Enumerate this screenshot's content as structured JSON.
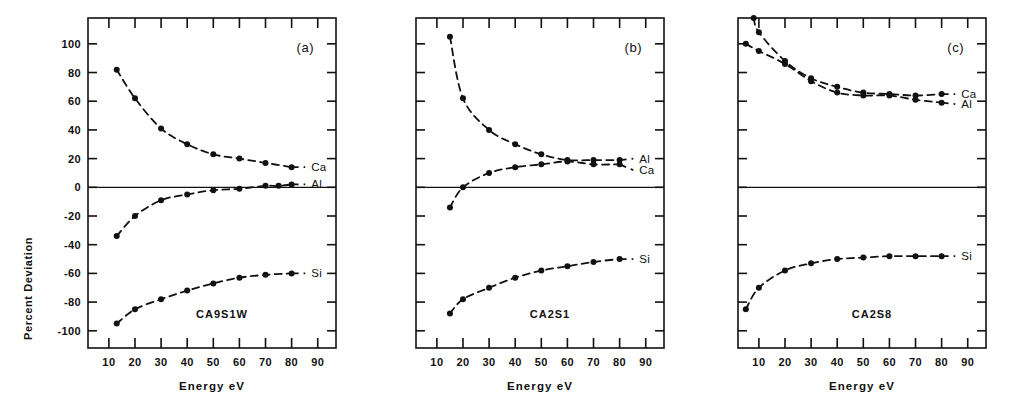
{
  "figure": {
    "background": "#ffffff",
    "ink_color": "#111111",
    "ylabel": "Percent Deviation",
    "xlabel": "Energy eV",
    "y_ticks": [
      100,
      80,
      60,
      40,
      20,
      0,
      -20,
      -40,
      -60,
      -80,
      -100
    ],
    "y_tick_labels": [
      "100",
      "80",
      "60",
      "40",
      "20",
      "0",
      "-20",
      "-40",
      "-60",
      "-80",
      "-100"
    ],
    "x_ticks": [
      10,
      20,
      30,
      40,
      50,
      60,
      70,
      80,
      90
    ],
    "x_tick_labels": [
      "10",
      "20",
      "30",
      "40",
      "50",
      "60",
      "70",
      "80",
      "90"
    ],
    "ylim": [
      -112,
      118
    ],
    "xlim": [
      2,
      97
    ]
  },
  "chart_data": [
    {
      "type": "line",
      "panel_id": "(a)",
      "sample": "CA9S1W",
      "title": "",
      "xlabel": "Energy eV",
      "ylabel": "Percent Deviation",
      "xlim": [
        2,
        97
      ],
      "ylim": [
        -112,
        118
      ],
      "grid": false,
      "legend_position": "right-inline",
      "series": [
        {
          "name": "Ca",
          "label": "Ca",
          "label_x": 86,
          "label_y": 14,
          "x": [
            13,
            20,
            30,
            40,
            50,
            60,
            70,
            80
          ],
          "y": [
            82,
            62,
            41,
            30,
            23,
            20,
            17,
            14
          ]
        },
        {
          "name": "Al",
          "label": "Al",
          "label_x": 86,
          "label_y": 2,
          "x": [
            13,
            20,
            30,
            40,
            50,
            60,
            70,
            75,
            80
          ],
          "y": [
            -34,
            -20,
            -9,
            -5,
            -2,
            -1,
            1,
            1,
            2
          ]
        },
        {
          "name": "Si",
          "label": "Si",
          "label_x": 86,
          "label_y": -60,
          "x": [
            13,
            20,
            30,
            40,
            50,
            60,
            70,
            80
          ],
          "y": [
            -95,
            -85,
            -78,
            -72,
            -67,
            -63,
            -61,
            -60
          ]
        }
      ]
    },
    {
      "type": "line",
      "panel_id": "(b)",
      "sample": "CA2S1",
      "title": "",
      "xlabel": "Energy eV",
      "ylabel": "Percent Deviation",
      "xlim": [
        2,
        97
      ],
      "ylim": [
        -112,
        118
      ],
      "grid": false,
      "legend_position": "right-inline",
      "series": [
        {
          "name": "Al",
          "label": "Al",
          "label_x": 86,
          "label_y": 20,
          "x": [
            15,
            20,
            30,
            40,
            50,
            60,
            70,
            80
          ],
          "y": [
            105,
            62,
            40,
            30,
            23,
            19,
            19,
            19
          ]
        },
        {
          "name": "Ca",
          "label": "Ca",
          "label_x": 86,
          "label_y": 12,
          "x": [
            15,
            20,
            30,
            40,
            50,
            60,
            70,
            80
          ],
          "y": [
            -14,
            0,
            10,
            14,
            16,
            18,
            16,
            16
          ]
        },
        {
          "name": "Si",
          "label": "Si",
          "label_x": 86,
          "label_y": -50,
          "x": [
            15,
            20,
            30,
            40,
            50,
            60,
            70,
            80
          ],
          "y": [
            -88,
            -78,
            -70,
            -63,
            -58,
            -55,
            -52,
            -50
          ]
        }
      ]
    },
    {
      "type": "line",
      "panel_id": "(c)",
      "sample": "CA2S8",
      "title": "",
      "xlabel": "Energy eV",
      "ylabel": "Percent Deviation",
      "xlim": [
        2,
        97
      ],
      "ylim": [
        -112,
        118
      ],
      "grid": false,
      "legend_position": "right-inline",
      "series": [
        {
          "name": "Ca",
          "label": "Ca",
          "label_x": 86,
          "label_y": 65,
          "x": [
            8,
            10,
            20,
            30,
            40,
            50,
            60,
            70,
            80
          ],
          "y": [
            118,
            108,
            88,
            76,
            70,
            66,
            65,
            64,
            65
          ]
        },
        {
          "name": "Al",
          "label": "Al",
          "label_x": 86,
          "label_y": 58,
          "x": [
            5,
            10,
            20,
            30,
            40,
            50,
            60,
            70,
            80
          ],
          "y": [
            100,
            95,
            86,
            74,
            66,
            64,
            64,
            61,
            59
          ]
        },
        {
          "name": "Si",
          "label": "Si",
          "label_x": 86,
          "label_y": -48,
          "x": [
            5,
            10,
            20,
            30,
            40,
            50,
            60,
            70,
            80
          ],
          "y": [
            -85,
            -70,
            -58,
            -53,
            -50,
            -49,
            -48,
            -48,
            -48
          ]
        }
      ]
    }
  ]
}
